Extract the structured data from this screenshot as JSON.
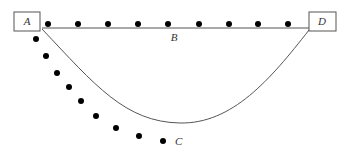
{
  "diagram": {
    "nodes": {
      "A": {
        "label": "A",
        "box": {
          "x": 14,
          "y": 12,
          "w": 26,
          "h": 19
        },
        "text_pos": {
          "x": 27,
          "y": 25
        }
      },
      "D": {
        "label": "D",
        "box": {
          "x": 309,
          "y": 12,
          "w": 27,
          "h": 19
        },
        "text_pos": {
          "x": 322,
          "y": 25
        }
      },
      "B": {
        "label": "B",
        "text_pos": {
          "x": 174,
          "y": 41
        }
      },
      "C": {
        "label": "C",
        "text_pos": {
          "x": 175,
          "y": 145
        }
      }
    },
    "edges": [
      {
        "name": "straight-edge-A-D",
        "path": "M42 28 L309 28"
      },
      {
        "name": "curved-edge-A-D",
        "path": "M42 29 C 95 85, 125 122, 180 123 C 232 124, 270 80, 309 30"
      }
    ],
    "dots_top": [
      {
        "x": 48,
        "y": 24
      },
      {
        "x": 78,
        "y": 24
      },
      {
        "x": 108,
        "y": 24
      },
      {
        "x": 138,
        "y": 24
      },
      {
        "x": 168,
        "y": 24
      },
      {
        "x": 199,
        "y": 24
      },
      {
        "x": 229,
        "y": 24
      },
      {
        "x": 258,
        "y": 24
      },
      {
        "x": 288,
        "y": 24
      }
    ],
    "dots_diagonal": [
      {
        "x": 36,
        "y": 39
      },
      {
        "x": 46,
        "y": 56
      },
      {
        "x": 57,
        "y": 73
      },
      {
        "x": 69,
        "y": 87
      },
      {
        "x": 81,
        "y": 101
      },
      {
        "x": 96,
        "y": 116
      },
      {
        "x": 116,
        "y": 128
      },
      {
        "x": 139,
        "y": 136
      },
      {
        "x": 163,
        "y": 141
      }
    ],
    "dot_radius": 3
  }
}
